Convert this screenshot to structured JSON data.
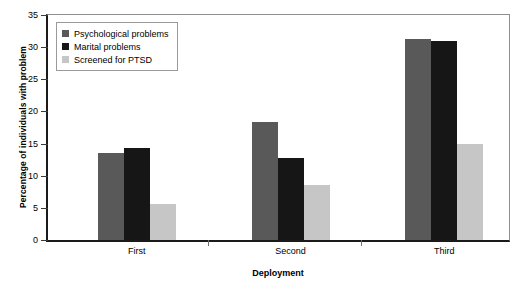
{
  "chart_data": {
    "type": "bar",
    "title": "",
    "xlabel": "Deployment",
    "ylabel": "Percentage of individuals with problem",
    "categories": [
      "First",
      "Second",
      "Third"
    ],
    "series": [
      {
        "name": "Psychological problems",
        "color": "#595959",
        "values": [
          13.6,
          18.3,
          31.2
        ]
      },
      {
        "name": "Marital problems",
        "color": "#161616",
        "values": [
          14.3,
          12.7,
          31.0
        ]
      },
      {
        "name": "Screened for PTSD",
        "color": "#c6c6c6",
        "values": [
          5.6,
          8.5,
          14.9
        ]
      }
    ],
    "ylim": [
      0,
      35
    ],
    "yticks": [
      0,
      5,
      10,
      15,
      20,
      25,
      30,
      35
    ],
    "ytick_labels": [
      "0",
      "5",
      "10",
      "15",
      "20",
      "25",
      "30",
      "35"
    ],
    "grid": false,
    "legend_position": "upper-left"
  }
}
